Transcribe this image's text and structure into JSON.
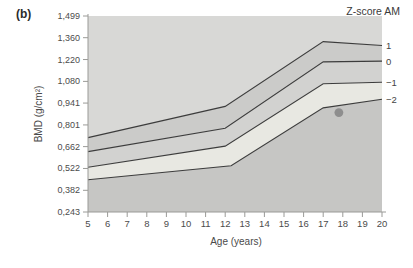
{
  "panel_label": "(b)",
  "chart_data": {
    "type": "line",
    "title": "Z-score AM",
    "xlabel": "Age (years)",
    "ylabel": "BMD (g/cm²)",
    "xlim": [
      5,
      20
    ],
    "ylim": [
      0.243,
      1.499
    ],
    "grid": false,
    "legend_position": "right-of-lines",
    "x_ticks": [
      5,
      6,
      7,
      8,
      9,
      10,
      11,
      12,
      13,
      14,
      15,
      16,
      17,
      18,
      19,
      20
    ],
    "y_ticks": [
      {
        "value": 1.499,
        "label": "1,499"
      },
      {
        "value": 1.36,
        "label": "1,360"
      },
      {
        "value": 1.22,
        "label": "1,220"
      },
      {
        "value": 1.08,
        "label": "1,080"
      },
      {
        "value": 0.941,
        "label": "0,941"
      },
      {
        "value": 0.801,
        "label": "0,801"
      },
      {
        "value": 0.662,
        "label": "0,662"
      },
      {
        "value": 0.522,
        "label": "0,522"
      },
      {
        "value": 0.382,
        "label": "0,382"
      },
      {
        "value": 0.243,
        "label": "0,243"
      }
    ],
    "series": [
      {
        "name": "zscore-plus-1",
        "label": "1",
        "x": [
          5,
          12,
          17,
          20
        ],
        "values": [
          0.72,
          0.92,
          1.335,
          1.31
        ]
      },
      {
        "name": "zscore-0",
        "label": "0",
        "x": [
          5,
          12,
          17,
          20
        ],
        "values": [
          0.63,
          0.78,
          1.205,
          1.21
        ]
      },
      {
        "name": "zscore-minus-1",
        "label": "−1",
        "x": [
          5,
          12,
          17,
          20
        ],
        "values": [
          0.53,
          0.665,
          1.065,
          1.075
        ]
      },
      {
        "name": "zscore-minus-2",
        "label": "−2",
        "x": [
          5,
          12.3,
          17,
          20
        ],
        "values": [
          0.45,
          0.54,
          0.91,
          0.965
        ]
      }
    ],
    "point": {
      "name": "patient-measurement",
      "x": 17.8,
      "value": 0.88
    },
    "colors": {
      "bands": [
        "#d8d8d6",
        "#cbcbc9",
        "#d2d2d0",
        "#e8e8e2",
        "#c6c6c4"
      ],
      "line": "#3c3c3c",
      "axis": "#9a9a97",
      "tick_text": "#4c4c4c",
      "point": "#8e8e8e"
    }
  }
}
